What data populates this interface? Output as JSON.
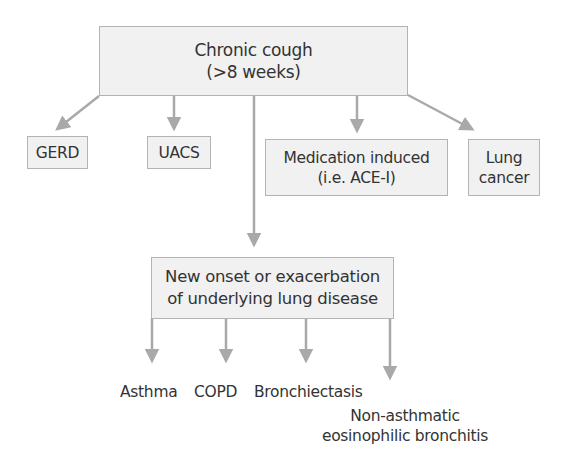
{
  "diagram": {
    "root": {
      "line1": "Chronic cough",
      "line2": "(>8 weeks)"
    },
    "causes": [
      {
        "id": "gerd",
        "label": "GERD"
      },
      {
        "id": "uacs",
        "label": "UACS"
      },
      {
        "id": "medication",
        "line1": "Medication induced",
        "line2": "(i.e. ACE-I)"
      },
      {
        "id": "lung-cancer",
        "line1": "Lung",
        "line2": "cancer"
      }
    ],
    "lung_disease": {
      "line1": "New onset or exacerbation",
      "line2": "of underlying lung disease"
    },
    "lung_disease_children": [
      {
        "id": "asthma",
        "label": "Asthma"
      },
      {
        "id": "copd",
        "label": "COPD"
      },
      {
        "id": "bronchiectasis",
        "label": "Bronchiectasis"
      },
      {
        "id": "naeb",
        "line1": "Non-asthmatic",
        "line2": "eosinophilic bronchitis"
      }
    ],
    "colors": {
      "box_fill": "#f1f1f1",
      "box_border": "#b3b3b3",
      "arrow": "#a9a9a9",
      "text": "#333333"
    }
  }
}
